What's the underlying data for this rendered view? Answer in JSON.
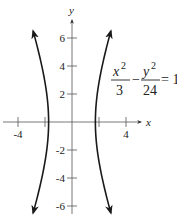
{
  "chart_data": {
    "type": "line",
    "title": "",
    "xlabel": "x",
    "ylabel": "y",
    "xlim": [
      -5,
      5
    ],
    "ylim": [
      -6.5,
      6.5
    ],
    "x_ticks": [
      -4,
      -2,
      2,
      4
    ],
    "x_tick_labels": [
      {
        "value": -4,
        "label": "-4"
      },
      {
        "value": 4,
        "label": "4"
      }
    ],
    "y_ticks": [
      6,
      4,
      2,
      -2,
      -4,
      -6
    ],
    "y_tick_labels": [
      {
        "value": 6,
        "label": "6"
      },
      {
        "value": 4,
        "label": "4"
      },
      {
        "value": 2,
        "label": "2"
      },
      {
        "value": -2,
        "label": "-2"
      },
      {
        "value": -4,
        "label": "-4"
      },
      {
        "value": -6,
        "label": "-6"
      }
    ],
    "grid": false,
    "legend": "none",
    "series": [
      {
        "name": "right-branch",
        "equation": "x^2/3 - y^2/24 = 1",
        "a_squared": 3,
        "b_squared": 24,
        "branch": 1,
        "y_range": [
          -6.5,
          6.5
        ],
        "arrows": "both-ends"
      },
      {
        "name": "left-branch",
        "equation": "x^2/3 - y^2/24 = 1",
        "a_squared": 3,
        "b_squared": 24,
        "branch": -1,
        "y_range": [
          -6.5,
          6.5
        ],
        "arrows": "both-ends"
      }
    ],
    "annotations": [
      {
        "type": "equation",
        "text": "x^2/3 - y^2/24 = 1",
        "parts": {
          "num1": "x",
          "sup1": "2",
          "den1": "3",
          "minus": "−",
          "num2": "y",
          "sup2": "2",
          "den2": "24",
          "rhs": "= 1"
        },
        "placement": "upper-right"
      }
    ]
  },
  "colors": {
    "curve": "#1a1a1a",
    "axis": "#555555",
    "text": "#222222"
  }
}
